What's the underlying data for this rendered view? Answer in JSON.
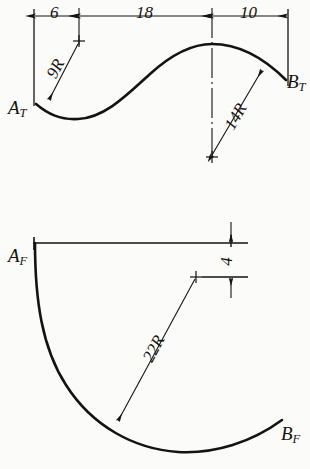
{
  "drawing": {
    "title": "Two-view engineering sketch of a curved part",
    "ink_color": "#15130f",
    "paper_color": "#fbfbf9",
    "views": [
      {
        "name": "top-view",
        "start_label": "A",
        "start_subscript": "T",
        "end_label": "B",
        "end_subscript": "T",
        "linear_dimensions": [
          {
            "value": "6",
            "orientation": "horizontal"
          },
          {
            "value": "18",
            "orientation": "horizontal"
          },
          {
            "value": "10",
            "orientation": "horizontal"
          }
        ],
        "radius_dimensions": [
          {
            "value": "9R",
            "orientation": "diagonal"
          },
          {
            "value": "14R",
            "orientation": "diagonal"
          }
        ]
      },
      {
        "name": "front-view",
        "start_label": "A",
        "start_subscript": "F",
        "end_label": "B",
        "end_subscript": "F",
        "linear_dimensions": [
          {
            "value": "4",
            "orientation": "vertical"
          }
        ],
        "radius_dimensions": [
          {
            "value": "22R",
            "orientation": "diagonal"
          }
        ]
      }
    ]
  }
}
